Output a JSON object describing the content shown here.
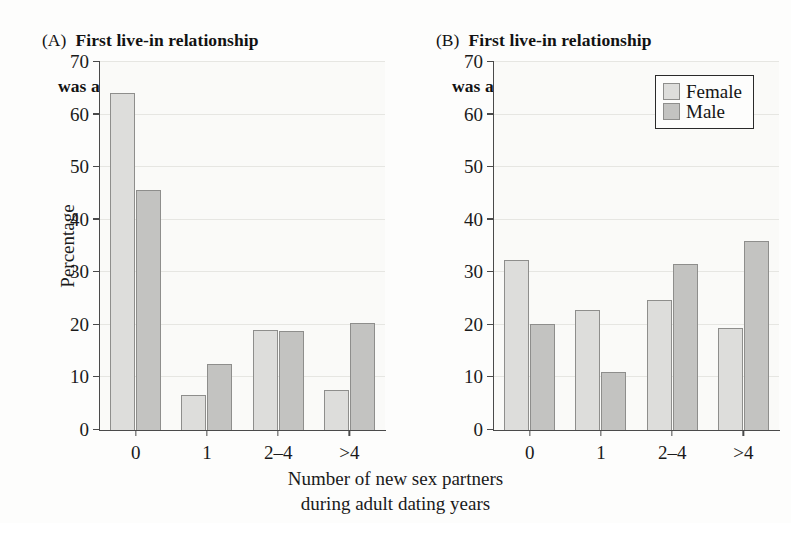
{
  "figure": {
    "background_color": "#fdfdfc",
    "panel_background_color": "#fafaf8"
  },
  "panels": [
    {
      "tag": "(A)",
      "title_line1": "First live-in relationship",
      "title_line2": "was a marriage"
    },
    {
      "tag": "(B)",
      "title_line1": "First live-in relationship",
      "title_line2": "was a cohabitation"
    }
  ],
  "axis": {
    "ylabel": "Percentage",
    "yticks": [
      "0",
      "10",
      "20",
      "30",
      "40",
      "50",
      "60",
      "70"
    ],
    "xticks": [
      "0",
      "1",
      "2–4",
      ">4"
    ],
    "xlabel_line1": "Number of new sex partners",
    "xlabel_line2": "during adult dating years"
  },
  "legend": {
    "position": "top-right-panel-b",
    "entries": [
      {
        "label": "Female",
        "color": "#dddddb"
      },
      {
        "label": "Male",
        "color": "#c3c3c1"
      }
    ]
  },
  "chart_data": [
    {
      "type": "bar",
      "title": "(A) First live-in relationship was a marriage",
      "categories": [
        "0",
        "1",
        "2–4",
        ">4"
      ],
      "series": [
        {
          "name": "Female",
          "color": "#dddddb",
          "values": [
            64.1,
            6.7,
            19.0,
            7.6
          ]
        },
        {
          "name": "Male",
          "color": "#c3c3c1",
          "values": [
            45.6,
            12.6,
            18.8,
            20.3
          ]
        }
      ],
      "xlabel": "Number of new sex partners during adult dating years",
      "ylabel": "Percentage",
      "ylim": [
        0,
        70
      ],
      "ytick_step": 10,
      "grid": true,
      "legend": false
    },
    {
      "type": "bar",
      "title": "(B) First live-in relationship was a cohabitation",
      "categories": [
        "0",
        "1",
        "2–4",
        ">4"
      ],
      "series": [
        {
          "name": "Female",
          "color": "#dddddb",
          "values": [
            32.3,
            22.8,
            24.8,
            19.5
          ]
        },
        {
          "name": "Male",
          "color": "#c3c3c1",
          "values": [
            20.1,
            11.0,
            31.6,
            36.0
          ]
        }
      ],
      "xlabel": "Number of new sex partners during adult dating years",
      "ylabel": "Percentage",
      "ylim": [
        0,
        70
      ],
      "ytick_step": 10,
      "grid": true,
      "legend": true
    }
  ]
}
